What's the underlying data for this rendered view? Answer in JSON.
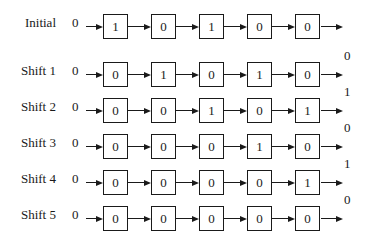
{
  "diagram": {
    "type": "shift-register",
    "rows": [
      {
        "label": "Initial",
        "input": "0",
        "cells": [
          "1",
          "0",
          "1",
          "0",
          "0"
        ],
        "output": ""
      },
      {
        "label": "Shift 1",
        "input": "0",
        "cells": [
          "0",
          "1",
          "0",
          "1",
          "0"
        ],
        "output": "0"
      },
      {
        "label": "Shift 2",
        "input": "0",
        "cells": [
          "0",
          "0",
          "1",
          "0",
          "1"
        ],
        "output": "1"
      },
      {
        "label": "Shift 3",
        "input": "0",
        "cells": [
          "0",
          "0",
          "0",
          "1",
          "0"
        ],
        "output": "0"
      },
      {
        "label": "Shift 4",
        "input": "0",
        "cells": [
          "0",
          "0",
          "0",
          "0",
          "1"
        ],
        "output": "1"
      },
      {
        "label": "Shift 5",
        "input": "0",
        "cells": [
          "0",
          "0",
          "0",
          "0",
          "0"
        ],
        "output": "0"
      }
    ]
  }
}
